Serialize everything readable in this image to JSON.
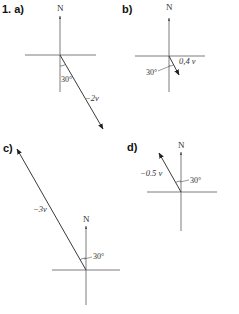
{
  "problem_number": "1.",
  "parts": [
    {
      "label": "a)",
      "north": "N",
      "angle": "30°",
      "vector": "−2v⃗",
      "scalar": -2,
      "direction": "30° east of south"
    },
    {
      "label": "b)",
      "north": "N",
      "angle": "30°",
      "vector": "0,4 v⃗",
      "scalar": 0.4,
      "direction": "30° east of south"
    },
    {
      "label": "c)",
      "north": "N",
      "angle": "30°",
      "vector": "−3v⃗",
      "scalar": -3,
      "direction": "30° west of north"
    },
    {
      "label": "d)",
      "north": "N",
      "angle": "30°",
      "vector": "−0.5 v⃗",
      "scalar": -0.5,
      "direction": "30° west of north"
    }
  ],
  "colors": {
    "axis": "#6e6e6e",
    "vector": "#3a3a3a",
    "text": "#111111"
  }
}
